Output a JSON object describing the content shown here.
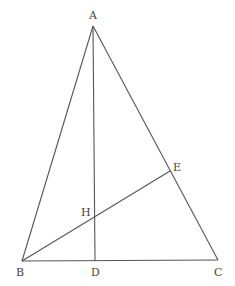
{
  "diagram": {
    "type": "triangle-with-altitudes",
    "points": {
      "A": {
        "label": "A",
        "x": 93,
        "y": 26,
        "lx": 89,
        "ly": 19
      },
      "B": {
        "label": "B",
        "x": 22,
        "y": 261,
        "lx": 16,
        "ly": 276
      },
      "C": {
        "label": "C",
        "x": 218,
        "y": 260,
        "lx": 214,
        "ly": 276
      },
      "D": {
        "label": "D",
        "x": 95,
        "y": 261,
        "lx": 91,
        "ly": 276
      },
      "E": {
        "label": "E",
        "x": 170,
        "y": 171,
        "lx": 173,
        "ly": 171
      },
      "H": {
        "label": "H",
        "x": 94,
        "y": 217,
        "lx": 81,
        "ly": 216
      }
    },
    "segments": [
      {
        "name": "AB",
        "from": "A",
        "to": "B"
      },
      {
        "name": "AC",
        "from": "A",
        "to": "C"
      },
      {
        "name": "BC",
        "from": "B",
        "to": "C"
      },
      {
        "name": "AD",
        "from": "A",
        "to": "D"
      },
      {
        "name": "BE",
        "from": "B",
        "to": "E"
      }
    ],
    "line_color": "#555555",
    "label_color": "#444444"
  }
}
